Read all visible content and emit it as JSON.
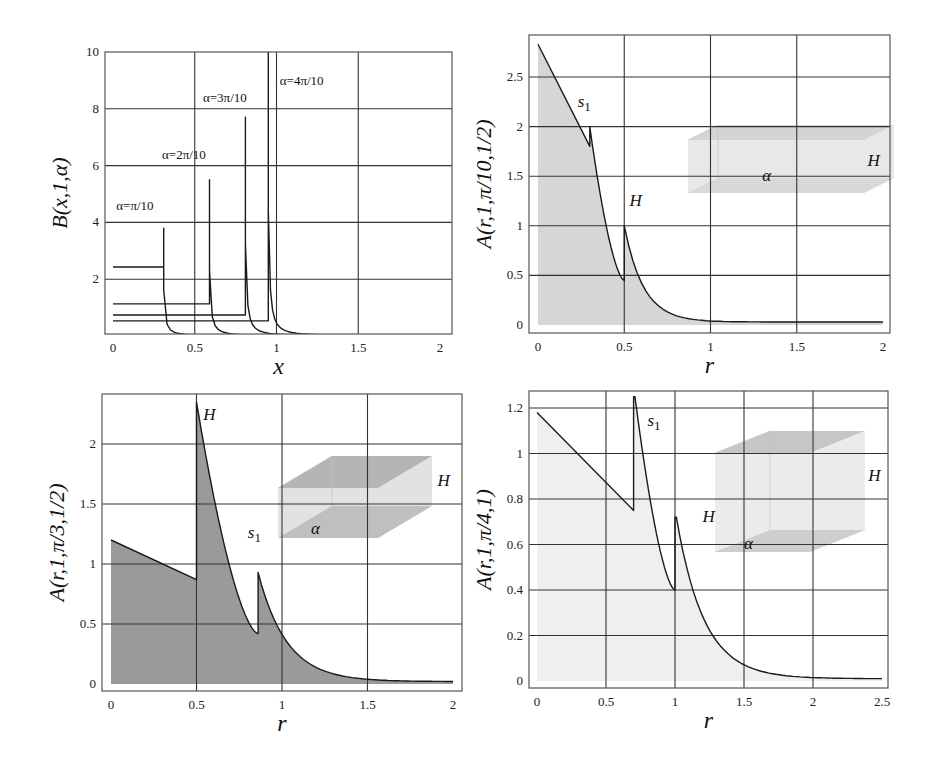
{
  "chart_data": [
    {
      "id": "B",
      "type": "line",
      "title": "",
      "xlabel": "x",
      "ylabel": "B(x,1,α)",
      "xlim": [
        0,
        2
      ],
      "ylim": [
        0,
        10
      ],
      "xticks": [
        "0",
        "0.5",
        "1",
        "1.5",
        "2"
      ],
      "xtick_values": [
        0,
        0.5,
        1,
        1.5,
        2
      ],
      "yticks": [
        "2",
        "4",
        "6",
        "8",
        "10"
      ],
      "ytick_values": [
        2,
        4,
        6,
        8,
        10
      ],
      "grid": true,
      "frame_px": {
        "left": 105,
        "top": 52,
        "right": 452,
        "bottom": 334
      },
      "axis_px": {
        "x0": 113,
        "x1": 440,
        "y0": 336,
        "y1": 52
      },
      "series": [
        {
          "name": "α=π/10",
          "flat": 2.43,
          "jump_x": 0.31,
          "peak": 3.8,
          "label_x": 0.02,
          "label_y": 4.45
        },
        {
          "name": "α=2π/10",
          "flat": 1.13,
          "jump_x": 0.59,
          "peak": 5.5,
          "label_x": 0.3,
          "label_y": 6.25
        },
        {
          "name": "α=3π/10",
          "flat": 0.74,
          "jump_x": 0.81,
          "peak": 7.7,
          "label_x": 0.55,
          "label_y": 8.25
        },
        {
          "name": "α=4π/10",
          "flat": 0.53,
          "jump_x": 0.95,
          "peak": 10.5,
          "label_x": 1.02,
          "label_y": 8.85
        }
      ]
    },
    {
      "id": "A1",
      "type": "area",
      "xlabel": "r",
      "ylabel": "A(r,1,π/10,1/2)",
      "xlim": [
        0,
        2
      ],
      "ylim": [
        0,
        2.9
      ],
      "xticks": [
        "0",
        "0.5",
        "1",
        "1.5",
        "2"
      ],
      "xtick_values": [
        0,
        0.5,
        1,
        1.5,
        2
      ],
      "yticks": [
        "0",
        "0.5",
        "1",
        "1.5",
        "2",
        "2.5"
      ],
      "ytick_values": [
        0,
        0.5,
        1,
        1.5,
        2,
        2.5
      ],
      "grid": true,
      "fill_color": "#d6d6d6",
      "frame_px": {
        "left": 529,
        "top": 35,
        "right": 890,
        "bottom": 333
      },
      "axis_px": {
        "x0": 538,
        "x1": 883,
        "y0": 325,
        "y1": 77,
        "y1_value": 2.5
      },
      "segments": [
        {
          "type": "line",
          "from": [
            0,
            2.83
          ],
          "to": [
            0.3,
            1.8
          ]
        },
        {
          "type": "jump",
          "x": 0.3,
          "to": 2.0
        },
        {
          "type": "decay",
          "from": [
            0.3,
            2.0
          ],
          "to": [
            0.5,
            0.45
          ],
          "shape": "convex"
        },
        {
          "type": "jump",
          "x": 0.5,
          "to": 1.0
        },
        {
          "type": "decay",
          "from": [
            0.5,
            1.0
          ],
          "to": [
            2.0,
            0.03
          ],
          "k": 9
        }
      ],
      "annotations": [
        {
          "text": "s",
          "sub": "1",
          "x": 0.23,
          "y": 2.2
        },
        {
          "text": "H",
          "x": 0.53,
          "y": 1.2
        },
        {
          "text": "H",
          "x": 1.91,
          "y": 1.6
        },
        {
          "text": "α",
          "x": 1.3,
          "y": 1.45
        }
      ],
      "inset": {
        "shape": "box",
        "front": [
          688,
          140,
          864,
          193
        ],
        "depth": [
          30,
          -15
        ],
        "fill": "#e4e4e4",
        "top_fill": "#cdcdcd"
      }
    },
    {
      "id": "A2",
      "type": "area",
      "xlabel": "r",
      "ylabel": "A(r,1,π/3,1/2)",
      "xlim": [
        0,
        2
      ],
      "ylim": [
        0,
        2.45
      ],
      "xticks": [
        "0",
        "0.5",
        "1",
        "1.5",
        "2"
      ],
      "xtick_values": [
        0,
        0.5,
        1,
        1.5,
        2
      ],
      "yticks": [
        "0",
        "0.5",
        "1",
        "1.5",
        "2"
      ],
      "ytick_values": [
        0,
        0.5,
        1,
        1.5,
        2
      ],
      "grid": true,
      "fill_color": "#9a9a9a",
      "frame_px": {
        "left": 102,
        "top": 394,
        "right": 462,
        "bottom": 691
      },
      "axis_px": {
        "x0": 111,
        "x1": 453,
        "y0": 684,
        "y1": 444,
        "y1_value": 2
      },
      "segments": [
        {
          "type": "line",
          "from": [
            0,
            1.2
          ],
          "to": [
            0.5,
            0.87
          ]
        },
        {
          "type": "jump",
          "x": 0.5,
          "to": 2.35
        },
        {
          "type": "decay",
          "from": [
            0.5,
            2.35
          ],
          "to": [
            0.86,
            0.42
          ],
          "shape": "convex"
        },
        {
          "type": "jump",
          "x": 0.86,
          "to": 0.93
        },
        {
          "type": "decay",
          "from": [
            0.86,
            0.93
          ],
          "to": [
            2.0,
            0.02
          ],
          "k": 6
        }
      ],
      "annotations": [
        {
          "text": "H",
          "x": 0.54,
          "y": 2.2
        },
        {
          "text": "s",
          "sub": "1",
          "x": 0.8,
          "y": 1.22
        },
        {
          "text": "H",
          "x": 1.91,
          "y": 1.65
        },
        {
          "text": "α",
          "x": 1.17,
          "y": 1.25
        }
      ],
      "inset": {
        "shape": "box",
        "front": [
          278,
          488,
          378,
          538
        ],
        "depth": [
          54,
          -32
        ],
        "fill": "#dedede",
        "top_fill": "#a9a9a9"
      }
    },
    {
      "id": "A3",
      "type": "area",
      "xlabel": "r",
      "ylabel": "A(r,1,π/4,1)",
      "xlim": [
        0,
        2.5
      ],
      "ylim": [
        0,
        1.28
      ],
      "xticks": [
        "0",
        "0.5",
        "1",
        "1.5",
        "2",
        "2.5"
      ],
      "xtick_values": [
        0,
        0.5,
        1,
        1.5,
        2,
        2.5
      ],
      "yticks": [
        "0",
        "0.2",
        "0.4",
        "0.6",
        "0.8",
        "1",
        "1.2"
      ],
      "ytick_values": [
        0,
        0.2,
        0.4,
        0.6,
        0.8,
        1,
        1.2
      ],
      "grid": true,
      "fill_color": "#efefef",
      "frame_px": {
        "left": 529,
        "top": 391,
        "right": 888,
        "bottom": 688
      },
      "axis_px": {
        "x0": 537,
        "x1": 882,
        "y0": 681,
        "y1": 408,
        "y1_value": 1.2
      },
      "segments": [
        {
          "type": "line",
          "from": [
            0,
            1.18
          ],
          "to": [
            0.7,
            0.75
          ]
        },
        {
          "type": "jump",
          "x": 0.7,
          "to": 1.25
        },
        {
          "type": "decay",
          "from": [
            0.71,
            1.25
          ],
          "to": [
            1.0,
            0.4
          ],
          "shape": "convex"
        },
        {
          "type": "jump",
          "x": 1.0,
          "to": 0.72
        },
        {
          "type": "decay",
          "from": [
            1.01,
            0.72
          ],
          "to": [
            2.5,
            0.01
          ],
          "k": 5
        }
      ],
      "annotations": [
        {
          "text": "s",
          "sub": "1",
          "x": 0.8,
          "y": 1.12
        },
        {
          "text": "H",
          "x": 1.2,
          "y": 0.7
        },
        {
          "text": "H",
          "x": 2.4,
          "y": 0.88
        },
        {
          "text": "α",
          "x": 1.5,
          "y": 0.58
        }
      ],
      "inset": {
        "shape": "box",
        "front": [
          715,
          453,
          810,
          552
        ],
        "depth": [
          55,
          -22
        ],
        "fill": "#e8e8e8",
        "top_fill": "#bdbdbd"
      }
    }
  ]
}
